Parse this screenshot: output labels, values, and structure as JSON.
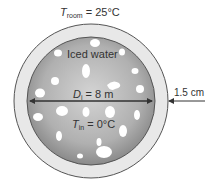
{
  "labels": {
    "t_room_sym": "T",
    "t_room_sub": "room",
    "t_room_val": " = 25°C",
    "contents": "Iced water",
    "d_sym": "D",
    "d_sub": "i",
    "d_val": " = 8 m",
    "t_in_sym": "T",
    "t_in_sub": "in",
    "t_in_val": " = 0°C",
    "thickness": "1.5 cm"
  },
  "colors": {
    "shell": "#e6e6e6",
    "water_center": "#cfcfcf",
    "water_edge": "#8e8e8e",
    "outline": "#555555",
    "ice": "#ffffff"
  }
}
